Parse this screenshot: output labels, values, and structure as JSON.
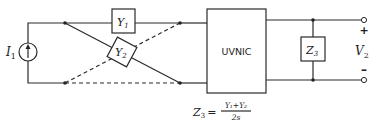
{
  "diagram": {
    "source": {
      "label": "I",
      "subscript": "1",
      "type": "current-source"
    },
    "admittances": [
      {
        "label": "Y",
        "subscript": "1"
      },
      {
        "label": "Y",
        "subscript": "2"
      }
    ],
    "block": {
      "label": "UVNIC"
    },
    "load": {
      "label": "Z",
      "subscript": "3"
    },
    "output": {
      "label": "V",
      "subscript": "2",
      "plus": "+",
      "minus": "–"
    },
    "equation": {
      "lhs": "Z",
      "lhs_subscript": "3",
      "equals": "=",
      "numerator": "Y₁+Y₂",
      "denominator": "2s"
    }
  }
}
